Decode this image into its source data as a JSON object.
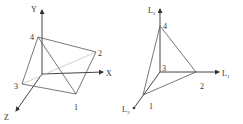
{
  "left_diagram": {
    "axes": {
      "y": "Y",
      "x": "X",
      "z": "Z"
    },
    "points": {
      "p1": "1",
      "p2": "2",
      "p3": "3",
      "p4": "4"
    }
  },
  "right_diagram": {
    "axes": {
      "up": "L2",
      "right": "L1",
      "down_left": "L3"
    },
    "points": {
      "p1": "1",
      "p2": "2",
      "p3": "3",
      "p4": "4"
    }
  },
  "colors": {
    "line": "#444444",
    "hidden_line": "#bbbbbb",
    "background": "#ffffff"
  }
}
